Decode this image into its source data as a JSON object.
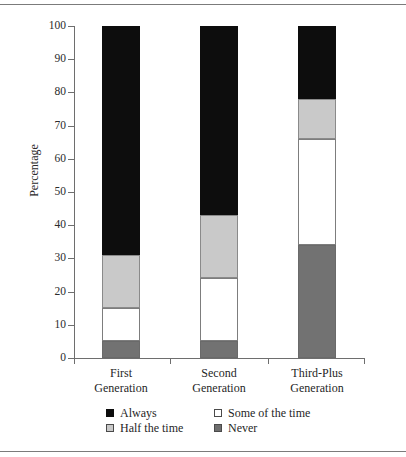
{
  "chart_data": {
    "type": "bar",
    "subtype": "stacked-bar-100",
    "title": "",
    "xlabel": "",
    "ylabel": "Percentage",
    "ylim": [
      0,
      100
    ],
    "yticks": [
      0,
      10,
      20,
      30,
      40,
      50,
      60,
      70,
      80,
      90,
      100
    ],
    "ytick_labels": [
      "0",
      "10",
      "20",
      "30",
      "40",
      "50",
      "60",
      "70",
      "80",
      "90",
      "100"
    ],
    "grid": false,
    "legend_position": "bottom",
    "categories": [
      "First Generation",
      "Second Generation",
      "Third-Plus Generation"
    ],
    "category_lines": [
      [
        "First",
        "Generation"
      ],
      [
        "Second",
        "Generation"
      ],
      [
        "Third-Plus",
        "Generation"
      ]
    ],
    "stack_order_bottom_to_top": [
      "Never",
      "Some of the time",
      "Half the time",
      "Always"
    ],
    "series": [
      {
        "name": "Never",
        "key": "never",
        "color": "#727272",
        "values": [
          5,
          5,
          34
        ]
      },
      {
        "name": "Some of the time",
        "key": "some",
        "color": "#ffffff",
        "values": [
          10,
          19,
          32
        ]
      },
      {
        "name": "Half the time",
        "key": "half",
        "color": "#c9c9c9",
        "values": [
          16,
          19,
          12
        ]
      },
      {
        "name": "Always",
        "key": "always",
        "color": "#0d0d0d",
        "values": [
          69,
          57,
          22
        ]
      }
    ],
    "cumulative_tops": [
      [
        5,
        15,
        31,
        100
      ],
      [
        5,
        24,
        43,
        100
      ],
      [
        34,
        66,
        78,
        100
      ]
    ]
  },
  "legend": {
    "items": [
      {
        "label": "Always",
        "swatch": "always"
      },
      {
        "label": "Some of the time",
        "swatch": "some"
      },
      {
        "label": "Half the time",
        "swatch": "half"
      },
      {
        "label": "Never",
        "swatch": "never"
      }
    ]
  },
  "colors": {
    "always": "#0d0d0d",
    "some_of_the_time": "#ffffff",
    "half_the_time": "#c9c9c9",
    "never": "#727272",
    "axis": "#6e6e6e",
    "text": "#1f1f1f",
    "background": "#ffffff"
  }
}
